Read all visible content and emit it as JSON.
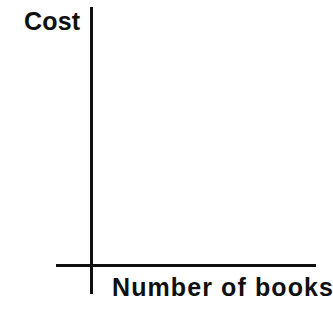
{
  "figure": {
    "width": 333,
    "height": 334,
    "background_color": "#ffffff",
    "ink_color": "#100f0f"
  },
  "chart_data": {
    "type": "line",
    "title": "",
    "subtitle": "",
    "xlabel": "Number of books",
    "ylabel": "Cost",
    "x": [],
    "values": [],
    "series": [],
    "categories": [],
    "xticklabels": [],
    "yticklabels": [],
    "xlim": null,
    "ylim": null,
    "grid": false,
    "legend": false,
    "legend_position": "none",
    "annotations": [],
    "note": "Blank axes template: both axes are drawn with no tick marks, no tick labels, no gridlines and no plotted data."
  },
  "axes": {
    "y_axis": {
      "label": "Cost",
      "orientation": "vertical",
      "has_ticks": false,
      "has_tick_labels": false,
      "has_arrowhead": false
    },
    "x_axis": {
      "label": "Number of books",
      "orientation": "horizontal",
      "has_ticks": false,
      "has_tick_labels": false,
      "has_arrowhead": false
    }
  }
}
